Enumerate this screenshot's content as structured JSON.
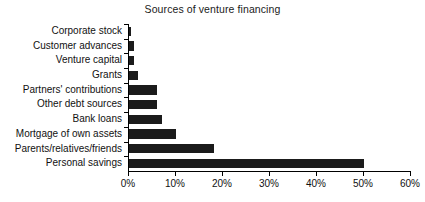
{
  "chart_data": {
    "type": "bar",
    "orientation": "horizontal",
    "title": "Sources of venture financing",
    "xlabel": "",
    "ylabel": "",
    "categories": [
      "Corporate stock",
      "Customer advances",
      "Venture capital",
      "Grants",
      "Partners' contributions",
      "Other debt sources",
      "Bank loans",
      "Mortgage of own assets",
      "Parents/relatives/friends",
      "Personal savings"
    ],
    "values": [
      0.4,
      1,
      1,
      2,
      6,
      6,
      7,
      10,
      18,
      50
    ],
    "value_unit": "%",
    "xlim": [
      0,
      60
    ],
    "xticks": [
      0,
      10,
      20,
      30,
      40,
      50,
      60
    ],
    "xtick_labels": [
      "0%",
      "10%",
      "20%",
      "30%",
      "40%",
      "50%",
      "60%"
    ],
    "grid": false,
    "legend": false,
    "bar_color": "#1b1b1b",
    "axis_color": "#000000",
    "background": "#ffffff"
  }
}
